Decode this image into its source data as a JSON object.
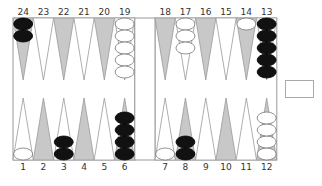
{
  "board": {
    "colors": {
      "dark_point": "#c8c8c8",
      "light_point": "#ffffff",
      "black_checker": "#111111",
      "white_checker": "#ffffff",
      "outline": "#999999"
    },
    "top_points": [
      {
        "n": 24,
        "shade": "dark",
        "checkers": 2,
        "color": "black"
      },
      {
        "n": 23,
        "shade": "light",
        "checkers": 0,
        "color": ""
      },
      {
        "n": 22,
        "shade": "dark",
        "checkers": 0,
        "color": ""
      },
      {
        "n": 21,
        "shade": "light",
        "checkers": 0,
        "color": ""
      },
      {
        "n": 20,
        "shade": "dark",
        "checkers": 0,
        "color": ""
      },
      {
        "n": 19,
        "shade": "light",
        "checkers": 5,
        "color": "white"
      },
      {
        "n": 18,
        "shade": "dark",
        "checkers": 0,
        "color": ""
      },
      {
        "n": 17,
        "shade": "light",
        "checkers": 3,
        "color": "white"
      },
      {
        "n": 16,
        "shade": "dark",
        "checkers": 0,
        "color": ""
      },
      {
        "n": 15,
        "shade": "light",
        "checkers": 0,
        "color": ""
      },
      {
        "n": 14,
        "shade": "dark",
        "checkers": 1,
        "color": "white"
      },
      {
        "n": 13,
        "shade": "light",
        "checkers": 5,
        "color": "black"
      }
    ],
    "bottom_points": [
      {
        "n": 1,
        "shade": "light",
        "checkers": 1,
        "color": "white"
      },
      {
        "n": 2,
        "shade": "dark",
        "checkers": 0,
        "color": ""
      },
      {
        "n": 3,
        "shade": "light",
        "checkers": 2,
        "color": "black"
      },
      {
        "n": 4,
        "shade": "dark",
        "checkers": 0,
        "color": ""
      },
      {
        "n": 5,
        "shade": "light",
        "checkers": 0,
        "color": ""
      },
      {
        "n": 6,
        "shade": "dark",
        "checkers": 4,
        "color": "black"
      },
      {
        "n": 7,
        "shade": "light",
        "checkers": 1,
        "color": "white"
      },
      {
        "n": 8,
        "shade": "dark",
        "checkers": 2,
        "color": "black"
      },
      {
        "n": 9,
        "shade": "light",
        "checkers": 0,
        "color": ""
      },
      {
        "n": 10,
        "shade": "dark",
        "checkers": 0,
        "color": ""
      },
      {
        "n": 11,
        "shade": "light",
        "checkers": 0,
        "color": ""
      },
      {
        "n": 12,
        "shade": "dark",
        "checkers": 4,
        "color": "white"
      }
    ]
  },
  "doubling_cube": {
    "value": ""
  }
}
